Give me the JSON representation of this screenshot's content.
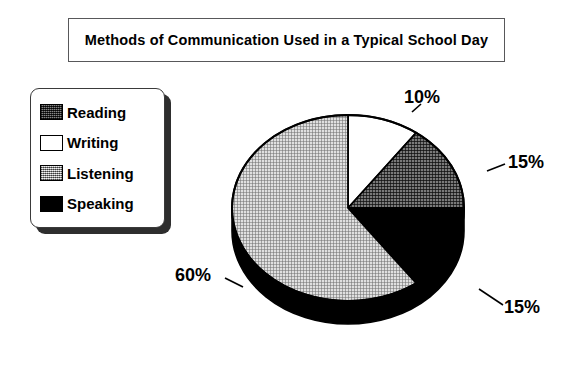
{
  "title": "Methods of Communication Used in a Typical School Day",
  "legend": {
    "items": [
      {
        "label": "Reading",
        "swatch": "dark-crosshatch-swatch"
      },
      {
        "label": "Writing",
        "swatch": "white-swatch"
      },
      {
        "label": "Listening",
        "swatch": "light-gray-crosshatch-swatch"
      },
      {
        "label": "Speaking",
        "swatch": "black-swatch"
      }
    ]
  },
  "labels": {
    "writing": "10%",
    "reading": "15%",
    "speaking": "15%",
    "listening": "60%"
  },
  "chart_data": {
    "type": "pie",
    "title": "Methods of Communication Used in a Typical School Day",
    "categories": [
      "Writing",
      "Reading",
      "Speaking",
      "Listening"
    ],
    "values": [
      10,
      15,
      15,
      60
    ],
    "value_labels": [
      "10%",
      "15%",
      "15%",
      "60%"
    ],
    "unit": "percent",
    "start_angle_oclock": 12,
    "direction": "clockwise",
    "three_d": true,
    "legend_position": "left",
    "legend_order": [
      "Reading",
      "Writing",
      "Listening",
      "Speaking"
    ],
    "slice_fills": {
      "Writing": "#ffffff",
      "Reading": "#6b6b6b",
      "Speaking": "#000000",
      "Listening": "#c9c9c9"
    },
    "grid": false
  },
  "colors": {
    "outline": "#000000",
    "pie_side": "#000000",
    "writing_fill": "#ffffff",
    "reading_fill": "#6b6b6b",
    "speaking_fill": "#000000",
    "listening_fill": "#c9c9c9",
    "title_border": "#58585a",
    "legend_shadow": "#2e2e2e"
  }
}
